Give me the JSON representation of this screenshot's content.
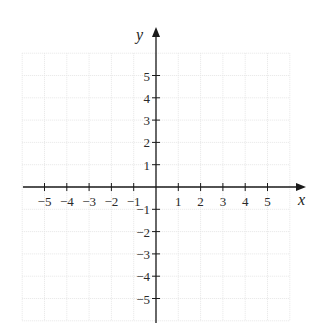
{
  "chart_data": {
    "type": "scatter",
    "title": "",
    "xlabel": "x",
    "ylabel": "y",
    "xlim": [
      -6,
      6
    ],
    "ylim": [
      -6,
      6
    ],
    "grid": true,
    "x_ticks": [
      -5,
      -4,
      -3,
      -2,
      -1,
      1,
      2,
      3,
      4,
      5
    ],
    "y_ticks": [
      5,
      4,
      3,
      2,
      1,
      -1,
      -2,
      -3,
      -4,
      -5
    ],
    "x_tick_labels": [
      "−5",
      "−4",
      "−3",
      "−2",
      "−1",
      "1",
      "2",
      "3",
      "4",
      "5"
    ],
    "y_tick_labels": [
      "5",
      "4",
      "3",
      "2",
      "1",
      "−1",
      "−2",
      "−3",
      "−4",
      "−5"
    ],
    "series": [],
    "legend": null
  },
  "colors": {
    "axis": "#1a1a1a",
    "grid": "#e6e6e6",
    "text": "#2a2a2a"
  },
  "labels": {
    "x_axis": "x",
    "y_axis": "y"
  }
}
